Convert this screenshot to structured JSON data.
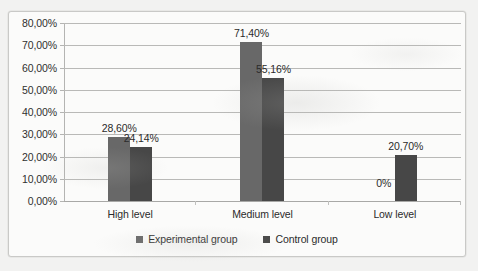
{
  "chart_data": {
    "type": "bar",
    "title": "",
    "subtitle": "",
    "xlabel": "",
    "ylabel": "",
    "categories": [
      "High level",
      "Medium level",
      "Low level"
    ],
    "series": [
      {
        "name": "Experimental group",
        "color": "#686868",
        "values": [
          28.6,
          71.4,
          0
        ],
        "labels": [
          "28,60%",
          "71,40%",
          "0%"
        ]
      },
      {
        "name": "Control group",
        "color": "#474747",
        "values": [
          24.14,
          55.16,
          20.7
        ],
        "labels": [
          "24,14%",
          "55,16%",
          "20,70%"
        ]
      }
    ],
    "ylim": [
      0,
      80
    ],
    "ytick_values": [
      0,
      10,
      20,
      30,
      40,
      50,
      60,
      70,
      80
    ],
    "ytick_labels": [
      "0,00%",
      "10,00%",
      "20,00%",
      "30,00%",
      "40,00%",
      "50,00%",
      "60,00%",
      "70,00%",
      "80,00%"
    ],
    "grid": true,
    "grid_axis": "y",
    "legend_position": "bottom",
    "decimal_separator": ","
  },
  "legend": {
    "items": [
      {
        "label": "Experimental group",
        "color": "#686868"
      },
      {
        "label": "Control group",
        "color": "#474747"
      }
    ]
  },
  "axes": {
    "y": {
      "ticks": [
        {
          "value": 80,
          "label": "80,00%"
        },
        {
          "value": 70,
          "label": "70,00%"
        },
        {
          "value": 60,
          "label": "60,00%"
        },
        {
          "value": 50,
          "label": "50,00%"
        },
        {
          "value": 40,
          "label": "40,00%"
        },
        {
          "value": 30,
          "label": "30,00%"
        },
        {
          "value": 20,
          "label": "20,00%"
        },
        {
          "value": 10,
          "label": "10,00%"
        },
        {
          "value": 0,
          "label": "0,00%"
        }
      ]
    },
    "x": {
      "ticks": [
        {
          "label": "High level"
        },
        {
          "label": "Medium level"
        },
        {
          "label": "Low level"
        }
      ]
    }
  },
  "colors": {
    "series_experimental": "#686868",
    "series_control": "#474747",
    "gridline": "#b9b9b7",
    "frame_border": "#c9c9c7",
    "plot_background": "#fbfbfa",
    "page_background": "#f2f2f1",
    "text": "#2b2b2b"
  }
}
